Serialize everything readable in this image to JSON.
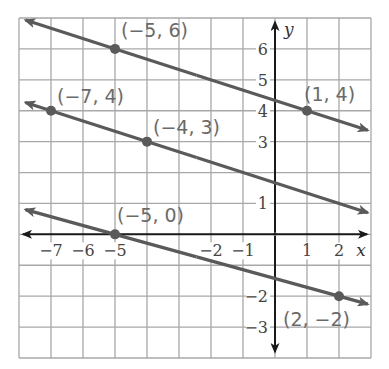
{
  "chart_data": {
    "type": "line",
    "title": "",
    "xlabel": "x",
    "ylabel": "y",
    "xlim": [
      -8,
      3
    ],
    "ylim": [
      -4,
      7
    ],
    "grid": true,
    "x_ticks": [
      -7,
      -6,
      -5,
      -2,
      -1,
      1,
      2
    ],
    "x_tick_labels": [
      "−7",
      "−6",
      "−5",
      "−2",
      "−1",
      "1",
      "2"
    ],
    "y_ticks": [
      6,
      5,
      4,
      3,
      1,
      -2,
      -3
    ],
    "y_tick_labels": [
      "6",
      "5",
      "4",
      "3",
      "1",
      "−2",
      "−3"
    ],
    "series": [
      {
        "name": "line through (-5, 6) and (1, 4)",
        "slope": -0.3333,
        "points": [
          {
            "x": -5,
            "y": 6,
            "label": "(−5, 6)"
          },
          {
            "x": 1,
            "y": 4,
            "label": "(1, 4)"
          }
        ]
      },
      {
        "name": "line through (-7, 4) and (-4, 3)",
        "slope": -0.3333,
        "points": [
          {
            "x": -7,
            "y": 4,
            "label": "(−7, 4)"
          },
          {
            "x": -4,
            "y": 3,
            "label": "(−4, 3)"
          }
        ]
      },
      {
        "name": "line through (-5, 0) and (2, -2)",
        "slope": -0.2857,
        "points": [
          {
            "x": -5,
            "y": 0,
            "label": "(−5, 0)"
          },
          {
            "x": 2,
            "y": -2,
            "label": "(2, −2)"
          }
        ]
      }
    ]
  },
  "colors": {
    "grid": "#a8a8a8",
    "axes": "#1a1a1a",
    "lines": "#5a5a5a",
    "labels": "#6a6a6a"
  }
}
